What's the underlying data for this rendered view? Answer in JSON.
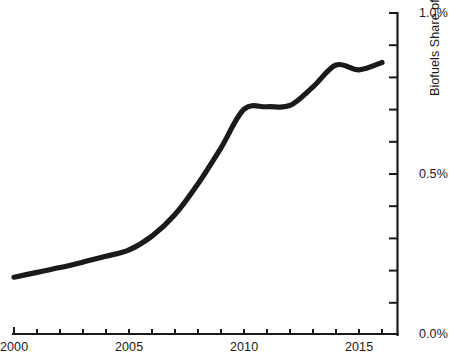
{
  "chart_data": {
    "type": "line",
    "title": "",
    "xlabel": "",
    "ylabel": "Biofuels Share of Primary Energy",
    "xlim": [
      2000,
      2016.6
    ],
    "ylim": [
      0.0,
      1.0
    ],
    "grid": false,
    "legend": "none",
    "line_color": "#1a1a1a",
    "x_tick_labels": [
      "2000",
      "2005",
      "2010",
      "2015"
    ],
    "x_tick_values": [
      2000,
      2005,
      2010,
      2015
    ],
    "x_minor_tick_values": [
      2000,
      2001,
      2002,
      2003,
      2004,
      2005,
      2006,
      2007,
      2008,
      2009,
      2010,
      2011,
      2012,
      2013,
      2014,
      2015,
      2016
    ],
    "y_tick_labels": [
      "0.0%",
      "0.5%",
      "1.0%"
    ],
    "y_tick_values": [
      0.0,
      0.5,
      1.0
    ],
    "y_minor_tick_values": [
      0.1,
      0.2,
      0.3,
      0.4,
      0.6,
      0.7,
      0.8,
      0.9
    ],
    "series": [
      {
        "name": "Biofuels Share of Primary Energy",
        "x": [
          2000,
          2001,
          2002,
          2003,
          2004,
          2005,
          2006,
          2007,
          2008,
          2009,
          2010,
          2011,
          2012,
          2013,
          2014,
          2015,
          2016
        ],
        "values": [
          0.177,
          0.192,
          0.207,
          0.224,
          0.242,
          0.262,
          0.305,
          0.372,
          0.468,
          0.58,
          0.7,
          0.708,
          0.712,
          0.77,
          0.838,
          0.823,
          0.846
        ]
      }
    ]
  },
  "axes": {
    "y_title": "Biofuels Share of Primary Energy"
  }
}
